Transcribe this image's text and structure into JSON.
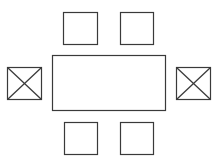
{
  "diagram": {
    "type": "floor-plan",
    "stroke_color": "#3a3a3a",
    "background": "#ffffff",
    "table": {
      "shape": "rectangle",
      "x": 52,
      "y": 55,
      "w": 114,
      "h": 56
    },
    "chairs": [
      {
        "id": "top-left",
        "style": "plain",
        "x": 63,
        "y": 12,
        "w": 35,
        "h": 33
      },
      {
        "id": "top-right",
        "style": "plain",
        "x": 120,
        "y": 12,
        "w": 34,
        "h": 33
      },
      {
        "id": "left",
        "style": "crossed",
        "x": 7,
        "y": 67,
        "w": 35,
        "h": 33
      },
      {
        "id": "right",
        "style": "crossed",
        "x": 176,
        "y": 67,
        "w": 35,
        "h": 33
      },
      {
        "id": "bottom-left",
        "style": "plain",
        "x": 64,
        "y": 122,
        "w": 34,
        "h": 33
      },
      {
        "id": "bottom-right",
        "style": "plain",
        "x": 120,
        "y": 122,
        "w": 34,
        "h": 33
      }
    ]
  }
}
